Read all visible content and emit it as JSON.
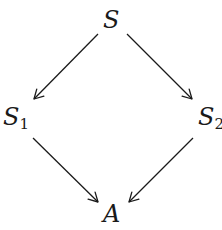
{
  "diagram": {
    "type": "commutative-diagram",
    "nodes": [
      {
        "id": "S",
        "label": "S",
        "subscript": ""
      },
      {
        "id": "S1",
        "label": "S",
        "subscript": "1"
      },
      {
        "id": "S2",
        "label": "S",
        "subscript": "2"
      },
      {
        "id": "A",
        "label": "A",
        "subscript": ""
      }
    ],
    "edges": [
      {
        "from": "S",
        "to": "S1"
      },
      {
        "from": "S",
        "to": "S2"
      },
      {
        "from": "S1",
        "to": "A"
      },
      {
        "from": "S2",
        "to": "A"
      }
    ],
    "colors": {
      "stroke": "#1a1a1a",
      "background": "#ffffff"
    }
  }
}
